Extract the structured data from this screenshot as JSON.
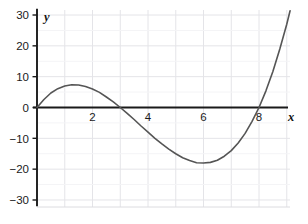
{
  "chart_data": {
    "type": "line",
    "title": "",
    "xlabel": "x",
    "ylabel": "y",
    "function": "y = 0.5x(x - 3)(x - 8)",
    "xlim": [
      -0.55,
      9.45
    ],
    "ylim": [
      -30,
      30
    ],
    "x_ticks": [
      2,
      4,
      6,
      8
    ],
    "x_tick_labels": [
      "2",
      "4",
      "6",
      "8"
    ],
    "y_ticks": [
      30,
      20,
      10,
      0,
      -10,
      -20,
      -30
    ],
    "y_tick_labels": [
      "30",
      "20",
      "10",
      "0",
      "−10",
      "−20",
      "−30"
    ],
    "grid": true,
    "legend": "none",
    "curve_color": "#555555",
    "axis_color": "#1a1a1a",
    "grid_color": "#e4e4e8",
    "roots": [
      0,
      3,
      8
    ],
    "local_maximum": {
      "x": 1.45,
      "y": 7.4
    },
    "local_minimum": {
      "x": 5.88,
      "y": -18.1
    },
    "points": [
      {
        "x": 0.0,
        "y": 0.0
      },
      {
        "x": 0.25,
        "y": 2.6
      },
      {
        "x": 0.5,
        "y": 4.7
      },
      {
        "x": 0.75,
        "y": 6.1
      },
      {
        "x": 1.0,
        "y": 7.0
      },
      {
        "x": 1.25,
        "y": 7.4
      },
      {
        "x": 1.5,
        "y": 7.3
      },
      {
        "x": 1.75,
        "y": 6.8
      },
      {
        "x": 2.0,
        "y": 6.0
      },
      {
        "x": 2.25,
        "y": 4.9
      },
      {
        "x": 2.5,
        "y": 3.4
      },
      {
        "x": 2.75,
        "y": 1.8
      },
      {
        "x": 3.0,
        "y": 0.0
      },
      {
        "x": 3.25,
        "y": -1.9
      },
      {
        "x": 3.5,
        "y": -3.9
      },
      {
        "x": 3.75,
        "y": -6.0
      },
      {
        "x": 4.0,
        "y": -8.0
      },
      {
        "x": 4.25,
        "y": -10.0
      },
      {
        "x": 4.5,
        "y": -11.8
      },
      {
        "x": 4.75,
        "y": -13.5
      },
      {
        "x": 5.0,
        "y": -15.0
      },
      {
        "x": 5.25,
        "y": -16.3
      },
      {
        "x": 5.5,
        "y": -17.2
      },
      {
        "x": 5.75,
        "y": -17.9
      },
      {
        "x": 6.0,
        "y": -18.0
      },
      {
        "x": 6.25,
        "y": -17.8
      },
      {
        "x": 6.5,
        "y": -17.1
      },
      {
        "x": 6.75,
        "y": -15.8
      },
      {
        "x": 7.0,
        "y": -14.0
      },
      {
        "x": 7.25,
        "y": -11.5
      },
      {
        "x": 7.5,
        "y": -8.4
      },
      {
        "x": 7.75,
        "y": -4.5
      },
      {
        "x": 8.0,
        "y": 0.0
      },
      {
        "x": 8.25,
        "y": 5.4
      },
      {
        "x": 8.5,
        "y": 11.7
      },
      {
        "x": 8.75,
        "y": 19.0
      },
      {
        "x": 9.0,
        "y": 27.0
      },
      {
        "x": 9.12,
        "y": 31.4
      }
    ]
  }
}
